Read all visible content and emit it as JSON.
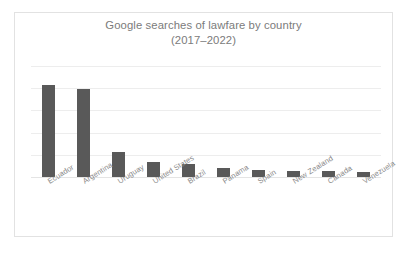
{
  "chart_data": {
    "type": "bar",
    "title": "Google searches of lawfare by country (2017–2022)",
    "title_line1": "Google searches of lawfare by country",
    "title_line2": "(2017–2022)",
    "xlabel": "",
    "ylabel": "",
    "categories": [
      "Ecuador",
      "Argentina",
      "Uruguay",
      "United States",
      "Brazil",
      "Panama",
      "Spain",
      "New Zealand",
      "Canada",
      "Venezuela"
    ],
    "values": [
      100,
      95,
      27,
      16,
      14,
      10,
      8,
      6,
      6,
      5
    ],
    "ylim": [
      0,
      120
    ],
    "y_gridline_values": [
      0,
      24,
      48,
      72,
      96,
      120
    ],
    "grid": true,
    "y_tick_labels_shown": false,
    "legend": null,
    "legend_position": "none",
    "bar_color": "#595959",
    "gridline_color": "#ededed",
    "title_color": "#7b7b7b",
    "label_color": "#8a8a8a",
    "background_color": "#ffffff",
    "border_color": "#e2e2e2"
  }
}
